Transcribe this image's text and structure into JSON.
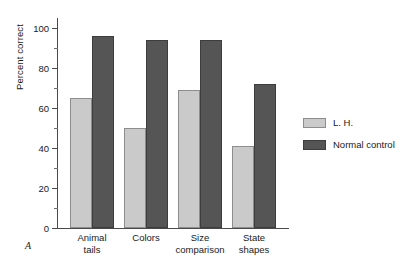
{
  "panel_label": "A",
  "chart_data": {
    "type": "bar",
    "title": "",
    "xlabel": "",
    "ylabel": "Percent correct",
    "ylim": [
      0,
      105
    ],
    "grid": false,
    "legend_position": "right",
    "categories": [
      "Animal tails",
      "Colors",
      "Size comparison",
      "State shapes"
    ],
    "categories_lines": [
      [
        "Animal",
        "tails"
      ],
      [
        "Colors",
        ""
      ],
      [
        "Size",
        "comparison"
      ],
      [
        "State",
        "shapes"
      ]
    ],
    "series": [
      {
        "name": "L. H.",
        "color": "#cacaca",
        "values": [
          65,
          50,
          69,
          41
        ]
      },
      {
        "name": "Normal control",
        "color": "#555555",
        "values": [
          96,
          94,
          94,
          72
        ]
      }
    ],
    "y_ticks_major": [
      0,
      20,
      40,
      60,
      80,
      100
    ],
    "y_tick_labels": [
      "0",
      "20",
      "40",
      "60",
      "80",
      "100"
    ],
    "y_ticks_minor": [
      10,
      30,
      50,
      70,
      90
    ]
  },
  "legend": {
    "items": [
      {
        "label": "L. H.",
        "swatch": "light"
      },
      {
        "label": "Normal control",
        "swatch": "dark"
      }
    ]
  }
}
